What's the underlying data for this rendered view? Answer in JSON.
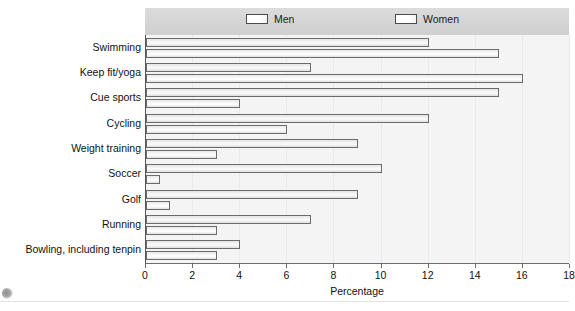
{
  "chart_data": {
    "type": "bar",
    "orientation": "horizontal",
    "title": "",
    "xlabel": "Percentage",
    "ylabel": "",
    "xlim": [
      0,
      18
    ],
    "xticks": [
      0,
      2,
      4,
      6,
      8,
      10,
      12,
      14,
      16,
      18
    ],
    "grid": false,
    "legend_position": "top",
    "categories": [
      "Swimming",
      "Keep fit/yoga",
      "Cue sports",
      "Cycling",
      "Weight training",
      "Soccer",
      "Golf",
      "Running",
      "Bowling, including tenpin"
    ],
    "series": [
      {
        "name": "Men",
        "values": [
          12,
          7,
          15,
          12,
          9,
          10,
          9,
          7,
          4
        ]
      },
      {
        "name": "Women",
        "values": [
          15,
          16,
          4,
          6,
          3,
          0.6,
          1,
          3,
          3
        ]
      }
    ]
  },
  "legend": {
    "entries": [
      {
        "label": "Men"
      },
      {
        "label": "Women"
      }
    ]
  },
  "axis": {
    "x_title": "Percentage",
    "x_tick_labels": [
      "0",
      "2",
      "4",
      "6",
      "8",
      "10",
      "12",
      "14",
      "16",
      "18"
    ]
  },
  "colors": {
    "legend_band": "#d6d6d6",
    "plot_background": "#f4f4f4",
    "bar_border": "#6b6b6b",
    "axis": "#6d6d6d",
    "text": "#111111"
  }
}
